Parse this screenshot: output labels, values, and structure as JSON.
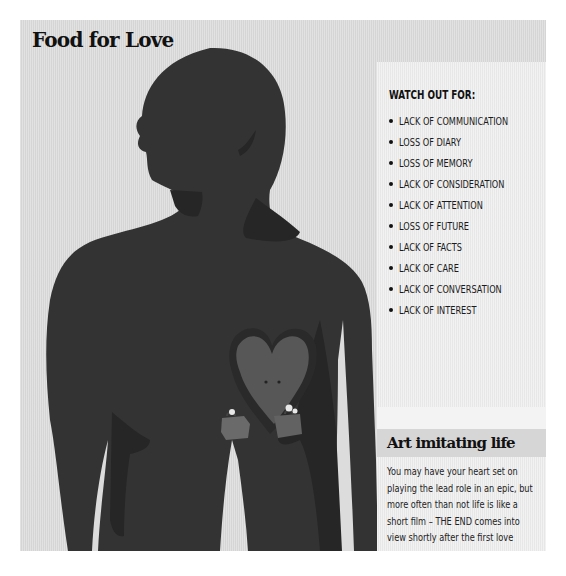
{
  "header": {
    "title": "Food for Love"
  },
  "illustration": {
    "subject": "man-silhouette-with-heart",
    "heart_detail": "heart-carrying-suitcases",
    "colors": {
      "background": "#dcdcdc",
      "silhouette": "#333333",
      "shadow": "#262626",
      "heart": "#555555",
      "suitcase": "#6a6a6a"
    }
  },
  "watch_out": {
    "heading": "WATCH OUT FOR:",
    "items": [
      "LACK OF COMMUNICATION",
      "LOSS OF DIARY",
      "LOSS OF MEMORY",
      "LACK OF CONSIDERATION",
      "LACK OF ATTENTION",
      "LOSS OF FUTURE",
      "LACK OF FACTS",
      "LACK OF CARE",
      "LACK OF CONVERSATION",
      "LACK OF INTEREST"
    ]
  },
  "art_section": {
    "title": "Art imitating life",
    "body": "You may have your heart set on playing the lead role in an epic, but more often than not life is like a short film – THE END comes into view shortly after the first love scene."
  }
}
